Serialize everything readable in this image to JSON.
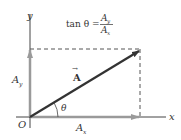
{
  "diagram": {
    "axes": {
      "x_label": "x",
      "y_label": "y",
      "origin_label": "O"
    },
    "vector": {
      "label": "A",
      "arrow_mark": "→"
    },
    "components": {
      "x_label": "A",
      "x_sub": "x",
      "y_label": "A",
      "y_sub": "y"
    },
    "angle_label": "θ",
    "formula": {
      "lhs": "tan θ =",
      "numerator": "A",
      "numerator_sub": "y",
      "denominator": "A",
      "denominator_sub": "x"
    },
    "colors": {
      "vector": "#333333",
      "component": "#9a9a9a",
      "axis": "#444444",
      "dashed": "#555555"
    }
  }
}
